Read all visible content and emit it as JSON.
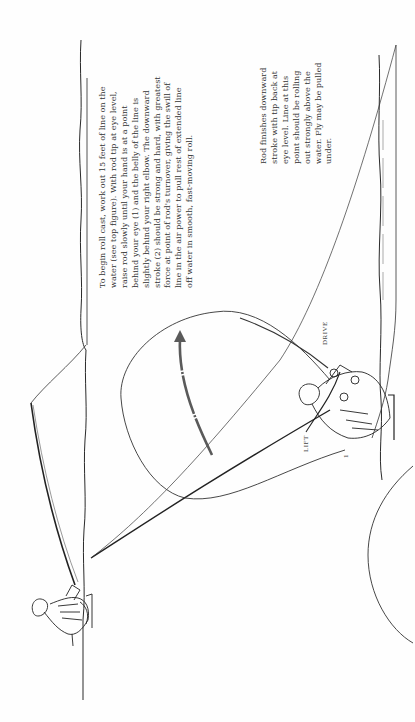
{
  "page": {
    "orientation": "rotated-90-ccw"
  },
  "caption_begin": {
    "lines": [
      "To begin roll cast, work out 15 feet of line on the",
      "water (see top figure). With rod tip at eye level,",
      "raise rod slowly until your hand is at a point",
      "behind your eye (1) and the belly of the line is",
      "slightly behind your right elbow. The downward",
      "stroke (2) should be strong and hard, with greatest",
      "force at point of rod's turnover, giving the swill of",
      "line in the air power to pull rest of extended line",
      "off water in smooth, fast-moving roll."
    ]
  },
  "caption_finish": {
    "lines": [
      "Rod finishes downward",
      "stroke with tip back at",
      "eye level. Line at this",
      "point should be rolling",
      "out strongly above the",
      "water. Fly may be pulled",
      "under."
    ]
  },
  "labels": {
    "lift": "LIFT",
    "drive": "DRIVE",
    "step_number": "1"
  },
  "colors": {
    "ink": "#2a2a2a",
    "arrow": "#5a5a5a",
    "paper": "#fefefe"
  }
}
